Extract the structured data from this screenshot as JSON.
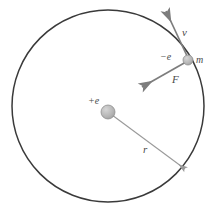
{
  "diagram": {
    "colors": {
      "orbit_stroke": "#3a3a3a",
      "vector_stroke": "#7d7d7d",
      "radius_stroke": "#9a9a9a",
      "particle_fill": "#b7b7b7",
      "particle_stroke": "#8f8f8f",
      "label_color": "#4a4a4a",
      "background": "#ffffff"
    },
    "orbit": {
      "center_x": 108,
      "center_y": 106,
      "radius": 96
    },
    "nucleus": {
      "label": "+e",
      "center_x": 108,
      "center_y": 112,
      "radius": 7
    },
    "electron": {
      "charge_label": "−e",
      "mass_label": "m",
      "center_x": 188,
      "center_y": 60,
      "radius": 5
    },
    "vectors": [
      {
        "name": "velocity",
        "label": "v",
        "from_x": 188,
        "from_y": 60,
        "to_x": 164,
        "to_y": 9
      },
      {
        "name": "force",
        "label": "F",
        "from_x": 188,
        "from_y": 60,
        "to_x": 140,
        "to_y": 88
      },
      {
        "name": "radius",
        "label": "r",
        "from_x": 108,
        "from_y": 112,
        "to_x": 187,
        "to_y": 170
      }
    ]
  }
}
